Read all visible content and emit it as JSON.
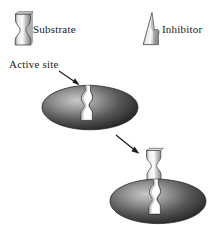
{
  "figure": {
    "background_color": "#ffffff"
  },
  "legend": {
    "items": [
      {
        "key": "substrate",
        "label": "Substrate",
        "icon": "hourglass-shape",
        "shape": "hourglass",
        "fill_light": "#f2f2f2",
        "fill_dark": "#6e6e6e",
        "stroke": "#2b2b2b"
      },
      {
        "key": "inhibitor",
        "label": "Inhibitor",
        "icon": "wedge-shape",
        "shape": "wedge",
        "fill_light": "#f4f4f4",
        "fill_dark": "#7a7a7a",
        "stroke": "#2b2b2b"
      }
    ]
  },
  "annotations": {
    "active_site": {
      "label": "Active site",
      "pointer": "arrow",
      "pointer_direction": "down-right"
    },
    "binding_arrow": {
      "label": "",
      "pointer": "arrow",
      "pointer_direction": "down-right"
    }
  },
  "enzymes": [
    {
      "key": "enzyme-top",
      "name": "enzyme-free",
      "fill_center": "#b4b4b4",
      "fill_edge": "#2e2e2e",
      "stroke": "#1c1c1c",
      "cleft_fill": "#ffffff",
      "substrate_bound": false
    },
    {
      "key": "enzyme-bottom",
      "name": "enzyme-with-substrate",
      "fill_center": "#b4b4b4",
      "fill_edge": "#2e2e2e",
      "stroke": "#1c1c1c",
      "cleft_fill": "#ffffff",
      "substrate_bound": true
    }
  ],
  "colors": {
    "text": "#1a1a1a",
    "arrow": "#1a1a1a",
    "enzyme_dark": "#2e2e2e",
    "enzyme_light": "#b4b4b4",
    "substrate_light": "#f2f2f2",
    "substrate_dark": "#6e6e6e"
  }
}
